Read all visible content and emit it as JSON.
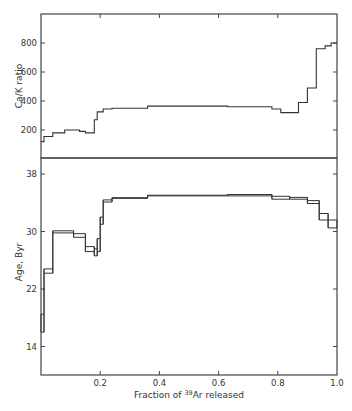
{
  "chart_data": [
    {
      "type": "line",
      "subtype": "step",
      "panel": "top",
      "title": "",
      "xlabel": "",
      "ylabel": "Ca/K ratio",
      "xlim": [
        0,
        1.0
      ],
      "ylim": [
        0,
        1000
      ],
      "yticks": [
        200,
        400,
        600,
        800
      ],
      "ytick_labels": [
        "200",
        "400",
        "600",
        "800"
      ],
      "xticks": [
        0.2,
        0.4,
        0.6,
        0.8
      ],
      "grid": false,
      "steps": [
        {
          "x0": 0.0,
          "x1": 0.01,
          "y": 120
        },
        {
          "x0": 0.01,
          "x1": 0.04,
          "y": 155
        },
        {
          "x0": 0.04,
          "x1": 0.08,
          "y": 180
        },
        {
          "x0": 0.08,
          "x1": 0.13,
          "y": 200
        },
        {
          "x0": 0.13,
          "x1": 0.15,
          "y": 190
        },
        {
          "x0": 0.15,
          "x1": 0.18,
          "y": 180
        },
        {
          "x0": 0.18,
          "x1": 0.19,
          "y": 270
        },
        {
          "x0": 0.19,
          "x1": 0.21,
          "y": 325
        },
        {
          "x0": 0.21,
          "x1": 0.24,
          "y": 345
        },
        {
          "x0": 0.24,
          "x1": 0.36,
          "y": 350
        },
        {
          "x0": 0.36,
          "x1": 0.63,
          "y": 365
        },
        {
          "x0": 0.63,
          "x1": 0.78,
          "y": 360
        },
        {
          "x0": 0.78,
          "x1": 0.81,
          "y": 345
        },
        {
          "x0": 0.81,
          "x1": 0.87,
          "y": 320
        },
        {
          "x0": 0.87,
          "x1": 0.9,
          "y": 390
        },
        {
          "x0": 0.9,
          "x1": 0.93,
          "y": 490
        },
        {
          "x0": 0.93,
          "x1": 0.96,
          "y": 760
        },
        {
          "x0": 0.96,
          "x1": 0.98,
          "y": 780
        },
        {
          "x0": 0.98,
          "x1": 1.0,
          "y": 800
        }
      ]
    },
    {
      "type": "line",
      "subtype": "step",
      "panel": "bottom",
      "title": "",
      "xlabel": "Fraction of 39Ar released",
      "ylabel": "Age, Byr",
      "xlim": [
        0,
        1.0
      ],
      "ylim": [
        9,
        40.5
      ],
      "yticks": [
        14,
        22,
        30,
        38
      ],
      "ytick_labels": [
        "14",
        "22",
        "30",
        "38"
      ],
      "xticks": [
        0.2,
        0.4,
        0.6,
        0.8,
        1.0
      ],
      "xtick_labels": [
        "0.2",
        "0.4",
        "0.6",
        "0.8",
        "1.0"
      ],
      "grid": false,
      "steps": [
        {
          "x0": 0.0,
          "x1": 0.01,
          "y_low": 16.0,
          "y_high": 18.5
        },
        {
          "x0": 0.01,
          "x1": 0.04,
          "y_low": 24.2,
          "y_high": 24.8
        },
        {
          "x0": 0.04,
          "x1": 0.11,
          "y_low": 29.8,
          "y_high": 30.1
        },
        {
          "x0": 0.11,
          "x1": 0.15,
          "y_low": 29.2,
          "y_high": 29.7
        },
        {
          "x0": 0.15,
          "x1": 0.18,
          "y_low": 27.2,
          "y_high": 27.9
        },
        {
          "x0": 0.18,
          "x1": 0.19,
          "y_low": 26.6,
          "y_high": 27.6
        },
        {
          "x0": 0.19,
          "x1": 0.2,
          "y_low": 27.2,
          "y_high": 29.0
        },
        {
          "x0": 0.2,
          "x1": 0.21,
          "y_low": 31.0,
          "y_high": 32.0
        },
        {
          "x0": 0.21,
          "x1": 0.24,
          "y_low": 34.1,
          "y_high": 34.4
        },
        {
          "x0": 0.24,
          "x1": 0.36,
          "y_low": 34.6,
          "y_high": 34.7
        },
        {
          "x0": 0.36,
          "x1": 0.63,
          "y_low": 34.95,
          "y_high": 35.05
        },
        {
          "x0": 0.63,
          "x1": 0.78,
          "y_low": 34.95,
          "y_high": 35.15
        },
        {
          "x0": 0.78,
          "x1": 0.84,
          "y_low": 34.5,
          "y_high": 34.9
        },
        {
          "x0": 0.84,
          "x1": 0.9,
          "y_low": 34.5,
          "y_high": 34.75
        },
        {
          "x0": 0.9,
          "x1": 0.94,
          "y_low": 33.9,
          "y_high": 34.3
        },
        {
          "x0": 0.94,
          "x1": 0.97,
          "y_low": 31.6,
          "y_high": 32.5
        },
        {
          "x0": 0.97,
          "x1": 1.0,
          "y_low": 30.5,
          "y_high": 31.6
        }
      ]
    }
  ],
  "labels": {
    "top_ylabel": "Ca/K ratio",
    "bottom_ylabel": "Age, Byr",
    "xlabel_prefix": "Fraction of ",
    "xlabel_sup": "39",
    "xlabel_suffix": "Ar released"
  },
  "colors": {
    "line": "#333333",
    "axis": "#444444",
    "background": "#ffffff"
  }
}
